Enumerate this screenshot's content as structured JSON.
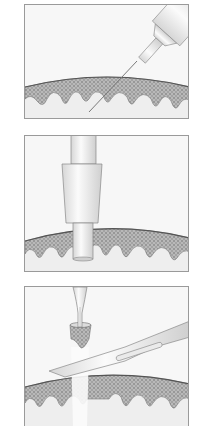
{
  "figure": {
    "panels": [
      {
        "id": "injection",
        "description": "Syringe needle injecting local anesthetic into skin"
      },
      {
        "id": "punch-biopsy",
        "description": "Punch biopsy tool inserted into skin"
      },
      {
        "id": "excision",
        "description": "Forceps lifting skin core while scalpel cuts base"
      }
    ],
    "colors": {
      "background": "#ffffff",
      "panel_fill": "#f4f4f4",
      "border": "#9a9a9a",
      "epidermis": "#a8a8a8",
      "dermis": "#eeeeee",
      "instrument": "#e6e6e6",
      "outline": "#6a6a6a"
    }
  }
}
